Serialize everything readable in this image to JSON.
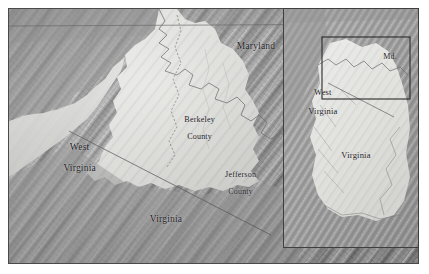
{
  "figure": {
    "type": "shaded-relief-map",
    "width": 429,
    "height": 274,
    "background_color": "#ffffff"
  },
  "main_map": {
    "name": "eastern-panhandle-west-virginia",
    "frame_color": "#4a4a4a",
    "terrain_style": "grayscale shaded relief, Appalachian ridge-and-valley",
    "labels": [
      {
        "id": "maryland",
        "text": "Maryland",
        "kind": "state",
        "x": 247,
        "y": 40,
        "lines": [
          "Maryland"
        ]
      },
      {
        "id": "berkeley-county",
        "text": "Berkeley County",
        "kind": "county",
        "x": 184,
        "y": 106,
        "lines": [
          "Berkeley",
          "County"
        ]
      },
      {
        "id": "jefferson-county",
        "text": "Jefferson County",
        "kind": "county",
        "x": 225,
        "y": 161,
        "lines": [
          "Jefferson",
          "County"
        ]
      },
      {
        "id": "west-virginia",
        "text": "West Virginia",
        "kind": "state",
        "x": 63,
        "y": 132,
        "lines": [
          "West",
          "Virginia"
        ]
      },
      {
        "id": "virginia",
        "text": "Virginia",
        "kind": "state",
        "x": 157,
        "y": 212,
        "lines": [
          "Virginia"
        ]
      }
    ],
    "boundaries": [
      {
        "id": "pennsylvania-maryland-line",
        "type": "state-line",
        "description": "straight horizontal Mason-Dixon line across top"
      },
      {
        "id": "west-virginia-virginia-line",
        "type": "state-line",
        "description": "straight diagonal line running NE to SW"
      },
      {
        "id": "maryland-west-virginia-line",
        "type": "state-line",
        "description": "irregular Potomac River boundary"
      },
      {
        "id": "berkeley-jefferson-line",
        "type": "county-line",
        "description": "dashed north-south county boundary"
      }
    ],
    "colors": {
      "terrain_dark": "#8c8c8c",
      "terrain_mid": "#a2a2a2",
      "terrain_light": "#d9d9d9",
      "lowland_bright": "#e8e8e6",
      "boundary_line": "#6e6e6e",
      "label_text": "#20201e"
    }
  },
  "inset_map": {
    "name": "regional-locator-inset",
    "frame_color": "#3f3f3f",
    "labels": [
      {
        "id": "inset-west-virginia",
        "text": "West Virginia",
        "kind": "state",
        "x": 30,
        "y": 78,
        "lines": [
          "West",
          "Virginia"
        ]
      },
      {
        "id": "inset-maryland",
        "text": "Md.",
        "kind": "state-abbr",
        "x": 106,
        "y": 50,
        "lines": [
          "Md."
        ]
      },
      {
        "id": "inset-virginia",
        "text": "Virginia",
        "kind": "state",
        "x": 72,
        "y": 148,
        "lines": [
          "Virginia"
        ]
      }
    ],
    "locator_box": {
      "id": "extent-rectangle",
      "description": "rectangle showing the extent of the main map",
      "x": 38,
      "y": 28,
      "width": 88,
      "height": 62,
      "stroke": "#2b2b2b"
    }
  }
}
